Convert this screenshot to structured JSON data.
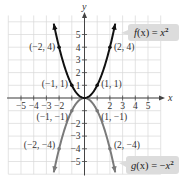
{
  "chart_data": {
    "type": "line",
    "title": "",
    "xlabel": "x",
    "ylabel": "y",
    "xlim": [
      -6,
      6
    ],
    "ylim": [
      -6,
      6
    ],
    "grid": true,
    "x_ticks": [
      -5,
      -4,
      -3,
      -2,
      2,
      3,
      4,
      5
    ],
    "y_ticks": [
      -5,
      -4,
      -3,
      -2,
      1,
      2,
      3,
      4,
      5
    ],
    "x_tick_labels": [
      "−5",
      "−4",
      "−3",
      "−2",
      "2",
      "3",
      "4",
      "5"
    ],
    "y_tick_labels": [
      "−5",
      "−4",
      "−3",
      "−2",
      "1",
      "2",
      "3",
      "4",
      "5"
    ],
    "series": [
      {
        "name": "f(x) = x²",
        "expression": "x^2",
        "color": "#111111",
        "x": [
          -2,
          -1,
          0,
          1,
          2
        ],
        "y": [
          4,
          1,
          0,
          1,
          4
        ],
        "labeled_points": [
          {
            "x": -2,
            "y": 4,
            "label": "(−2, 4)"
          },
          {
            "x": -1,
            "y": 1,
            "label": "(−1, 1)"
          },
          {
            "x": 1,
            "y": 1,
            "label": "(1, 1)"
          },
          {
            "x": 2,
            "y": 4,
            "label": "(2, 4)"
          }
        ]
      },
      {
        "name": "g(x) = −x²",
        "expression": "-x^2",
        "color": "#7a7a7a",
        "x": [
          -2,
          -1,
          0,
          1,
          2
        ],
        "y": [
          -4,
          -1,
          0,
          -1,
          -4
        ],
        "labeled_points": [
          {
            "x": -2,
            "y": -4,
            "label": "(−2, −4)"
          },
          {
            "x": -1,
            "y": -1,
            "label": "(−1, −1)"
          },
          {
            "x": 1,
            "y": -1,
            "label": "(1, −1)"
          },
          {
            "x": 2,
            "y": -4,
            "label": "(2, −4)"
          }
        ]
      }
    ],
    "legend": {
      "f": {
        "prefix": "f",
        "arg": "(x)",
        "eq": " = ",
        "rhs": "x",
        "sup": "2"
      },
      "g": {
        "prefix": "g",
        "arg": "(x)",
        "eq": " = −",
        "rhs": "x",
        "sup": "2"
      }
    }
  },
  "colors": {
    "grid": "#d9d9d9",
    "axis": "#444444",
    "f_curve": "#111111",
    "g_curve": "#7a7a7a",
    "label_box": "#dcdcdc"
  }
}
